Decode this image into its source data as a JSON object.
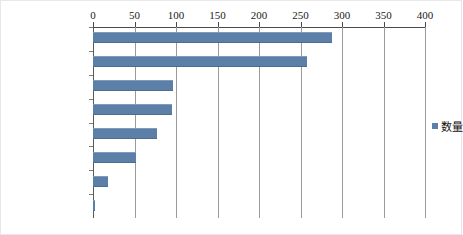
{
  "chart_data": {
    "type": "bar",
    "orientation": "horizontal",
    "title": "",
    "xlabel": "",
    "ylabel": "",
    "xlim": [
      0,
      400
    ],
    "xticks": [
      0,
      50,
      100,
      150,
      200,
      250,
      300,
      350,
      400
    ],
    "grid": true,
    "legend_position": "right",
    "series_color": "#5b7fa6",
    "categories": [
      "发布主体",
      "指导性案例编号",
      "发布批次",
      "发布日期",
      "裁判要点",
      "指导性案例标题",
      "指导性案例字号",
      "指导性案例案号"
    ],
    "series": [
      {
        "name": "数量",
        "values": [
          288,
          258,
          96,
          95,
          77,
          52,
          18,
          2
        ]
      }
    ]
  },
  "legend": {
    "entries": [
      {
        "label": "数量",
        "color": "#5b7fa6"
      }
    ]
  }
}
